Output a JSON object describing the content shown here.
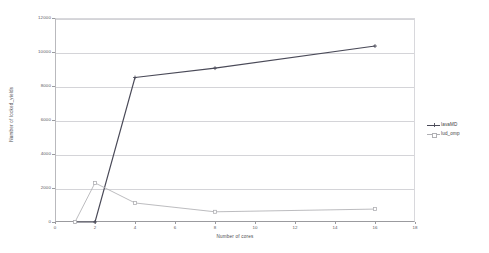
{
  "chart_data": {
    "type": "line",
    "title": "",
    "xlabel": "Number of cores",
    "ylabel": "Number of locked_yields",
    "xlim": [
      0,
      18
    ],
    "ylim": [
      0,
      12000
    ],
    "x_ticks": [
      "0",
      "2",
      "4",
      "6",
      "8",
      "10",
      "12",
      "14",
      "16",
      "18"
    ],
    "x_tick_values": [
      0,
      2,
      4,
      6,
      8,
      10,
      12,
      14,
      16,
      18
    ],
    "y_ticks": [
      "0",
      "2000",
      "4000",
      "6000",
      "8000",
      "10000",
      "12000"
    ],
    "y_tick_values": [
      0,
      2000,
      4000,
      6000,
      8000,
      10000,
      12000
    ],
    "grid": "horizontal",
    "legend_position": "right-outside",
    "x": [
      1,
      2,
      4,
      8,
      16
    ],
    "series": [
      {
        "name": "lavaMD",
        "color": "#4a4a58",
        "marker": "cross",
        "x": [
          1,
          2,
          4,
          8,
          16
        ],
        "values": [
          0,
          0,
          8500,
          9050,
          10350
        ]
      },
      {
        "name": "lud_omp",
        "color": "#b0b0b4",
        "marker": "square",
        "x": [
          1,
          2,
          4,
          8,
          16
        ],
        "values": [
          0,
          2300,
          1120,
          600,
          760
        ]
      }
    ]
  },
  "legend": {
    "entries": [
      {
        "label": "lavaMD"
      },
      {
        "label": "lud_omp"
      }
    ]
  },
  "colors": {
    "series_1": "#4a4a58",
    "series_2": "#b0b0b4",
    "gridline": "#d4d4d8",
    "axis": "#9b9b9f",
    "text": "#59595d",
    "background": "#ffffff"
  }
}
